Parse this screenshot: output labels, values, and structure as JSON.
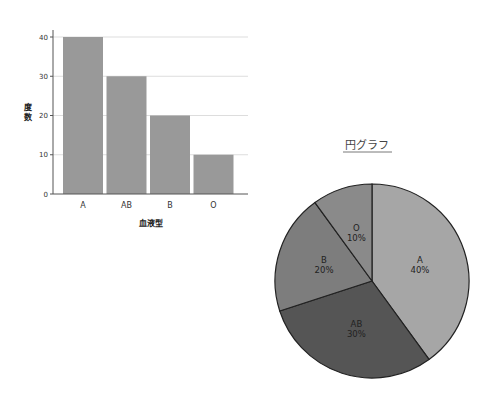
{
  "chart_data": [
    {
      "type": "bar",
      "title": "",
      "categories": [
        "A",
        "AB",
        "B",
        "O"
      ],
      "values": [
        40,
        30,
        20,
        10
      ],
      "xlabel": "血液型",
      "ylabel": "度数",
      "ylim": [
        0,
        40
      ],
      "yticks": [
        0,
        10,
        20,
        30,
        40
      ],
      "grid": true,
      "bar_color": "#999999"
    },
    {
      "type": "pie",
      "title": "円グラフ",
      "categories": [
        "A",
        "AB",
        "B",
        "O"
      ],
      "values": [
        40,
        30,
        20,
        10
      ],
      "labels": [
        "A\n40%",
        "AB\n30%",
        "B\n20%",
        "O\n10%"
      ],
      "percent_labels": [
        "40%",
        "30%",
        "20%",
        "10%"
      ],
      "colors": [
        "#a6a6a6",
        "#555555",
        "#7d7d7d",
        "#8a8a8a"
      ],
      "start_angle": "12 o'clock, clockwise"
    }
  ]
}
